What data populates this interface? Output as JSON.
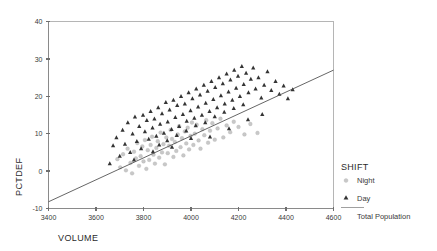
{
  "chart_data": {
    "type": "scatter",
    "title": "",
    "xlabel": "VOLUME",
    "ylabel": "PCTDEF",
    "xlim": [
      3400,
      4600
    ],
    "ylim": [
      -10,
      40
    ],
    "xticks": [
      3400,
      3600,
      3800,
      4000,
      4200,
      4400,
      4600
    ],
    "xtick_labels": [
      "3400",
      "3600",
      "3800",
      "4000",
      "4200",
      "4400",
      "4600"
    ],
    "yticks": [
      -10,
      0,
      10,
      20,
      30,
      40
    ],
    "ytick_labels": [
      "-10",
      "0",
      "10",
      "20",
      "30",
      "40"
    ],
    "grid": false,
    "legend": {
      "title": "SHIFT",
      "position": "right",
      "entries": [
        {
          "label": "Night",
          "marker": "circle",
          "color": "#c8c8c8"
        },
        {
          "label": "Day",
          "marker": "triangle",
          "color": "#343434"
        },
        {
          "label": "Total Population",
          "marker": "line",
          "color": "#555555"
        }
      ]
    },
    "fit_line": {
      "name": "Total Population",
      "x": [
        3400,
        4600
      ],
      "y": [
        -8.2,
        27.0
      ],
      "color": "#555555"
    },
    "series": [
      {
        "name": "Night",
        "marker": "circle",
        "color": "#c8c8c8",
        "points": [
          [
            3690,
            3.2
          ],
          [
            3702,
            1.0
          ],
          [
            3714,
            4.5
          ],
          [
            3726,
            0.2
          ],
          [
            3733,
            6.0
          ],
          [
            3745,
            2.2
          ],
          [
            3752,
            -0.6
          ],
          [
            3760,
            5.2
          ],
          [
            3768,
            3.4
          ],
          [
            3774,
            7.5
          ],
          [
            3781,
            1.4
          ],
          [
            3788,
            4.0
          ],
          [
            3795,
            6.6
          ],
          [
            3800,
            2.6
          ],
          [
            3806,
            8.3
          ],
          [
            3812,
            0.6
          ],
          [
            3818,
            5.6
          ],
          [
            3824,
            3.0
          ],
          [
            3830,
            7.0
          ],
          [
            3836,
            9.2
          ],
          [
            3842,
            4.4
          ],
          [
            3848,
            2.0
          ],
          [
            3854,
            6.2
          ],
          [
            3860,
            8.0
          ],
          [
            3866,
            3.6
          ],
          [
            3872,
            10.3
          ],
          [
            3878,
            5.0
          ],
          [
            3884,
            7.2
          ],
          [
            3890,
            1.8
          ],
          [
            3896,
            9.0
          ],
          [
            3902,
            4.8
          ],
          [
            3908,
            6.8
          ],
          [
            3914,
            11.0
          ],
          [
            3920,
            8.6
          ],
          [
            3926,
            3.8
          ],
          [
            3932,
            7.8
          ],
          [
            3938,
            5.4
          ],
          [
            3944,
            9.8
          ],
          [
            3950,
            12.0
          ],
          [
            3956,
            6.4
          ],
          [
            3962,
            8.8
          ],
          [
            3968,
            4.2
          ],
          [
            3974,
            10.6
          ],
          [
            3980,
            7.4
          ],
          [
            3986,
            11.6
          ],
          [
            3992,
            5.8
          ],
          [
            3998,
            9.4
          ],
          [
            4004,
            13.0
          ],
          [
            4010,
            7.0
          ],
          [
            4016,
            10.0
          ],
          [
            4024,
            12.4
          ],
          [
            4032,
            8.2
          ],
          [
            4040,
            6.0
          ],
          [
            4048,
            11.2
          ],
          [
            4056,
            9.6
          ],
          [
            4064,
            13.6
          ],
          [
            4072,
            7.6
          ],
          [
            4080,
            10.8
          ],
          [
            4090,
            12.8
          ],
          [
            4100,
            8.4
          ],
          [
            4112,
            11.4
          ],
          [
            4124,
            14.0
          ],
          [
            4136,
            9.0
          ],
          [
            4150,
            12.2
          ],
          [
            4165,
            10.4
          ],
          [
            4180,
            13.2
          ],
          [
            4200,
            11.8
          ],
          [
            4225,
            9.8
          ],
          [
            4250,
            12.6
          ],
          [
            4280,
            10.2
          ]
        ]
      },
      {
        "name": "Day",
        "marker": "triangle",
        "color": "#343434",
        "points": [
          [
            3658,
            2.0
          ],
          [
            3672,
            6.8
          ],
          [
            3686,
            9.0
          ],
          [
            3700,
            4.0
          ],
          [
            3712,
            11.0
          ],
          [
            3722,
            7.2
          ],
          [
            3734,
            13.0
          ],
          [
            3744,
            5.0
          ],
          [
            3754,
            10.0
          ],
          [
            3764,
            14.5
          ],
          [
            3772,
            8.0
          ],
          [
            3782,
            12.0
          ],
          [
            3790,
            6.0
          ],
          [
            3798,
            15.0
          ],
          [
            3806,
            10.6
          ],
          [
            3814,
            13.6
          ],
          [
            3822,
            8.6
          ],
          [
            3830,
            16.0
          ],
          [
            3838,
            11.6
          ],
          [
            3846,
            14.0
          ],
          [
            3854,
            9.4
          ],
          [
            3862,
            17.0
          ],
          [
            3870,
            12.6
          ],
          [
            3878,
            15.4
          ],
          [
            3886,
            10.2
          ],
          [
            3894,
            18.4
          ],
          [
            3902,
            13.2
          ],
          [
            3910,
            16.4
          ],
          [
            3918,
            11.2
          ],
          [
            3926,
            19.0
          ],
          [
            3934,
            14.4
          ],
          [
            3942,
            17.6
          ],
          [
            3950,
            12.0
          ],
          [
            3958,
            20.0
          ],
          [
            3966,
            15.2
          ],
          [
            3974,
            18.0
          ],
          [
            3982,
            13.4
          ],
          [
            3990,
            21.0
          ],
          [
            3998,
            16.2
          ],
          [
            4006,
            19.4
          ],
          [
            4014,
            14.2
          ],
          [
            4022,
            22.0
          ],
          [
            4030,
            17.2
          ],
          [
            4038,
            20.4
          ],
          [
            4046,
            15.0
          ],
          [
            4054,
            23.0
          ],
          [
            4062,
            18.2
          ],
          [
            4070,
            21.4
          ],
          [
            4078,
            16.0
          ],
          [
            4086,
            24.0
          ],
          [
            4094,
            19.2
          ],
          [
            4102,
            22.4
          ],
          [
            4110,
            17.0
          ],
          [
            4118,
            25.0
          ],
          [
            4126,
            20.2
          ],
          [
            4134,
            23.4
          ],
          [
            4142,
            18.0
          ],
          [
            4150,
            26.0
          ],
          [
            4158,
            21.2
          ],
          [
            4166,
            24.4
          ],
          [
            4174,
            19.0
          ],
          [
            4182,
            27.0
          ],
          [
            4190,
            22.2
          ],
          [
            4198,
            25.4
          ],
          [
            4206,
            20.0
          ],
          [
            4214,
            28.0
          ],
          [
            4222,
            23.2
          ],
          [
            4232,
            26.2
          ],
          [
            4242,
            21.0
          ],
          [
            4252,
            24.6
          ],
          [
            4262,
            27.6
          ],
          [
            4272,
            22.0
          ],
          [
            4284,
            25.0
          ],
          [
            4296,
            19.6
          ],
          [
            4308,
            23.0
          ],
          [
            4322,
            26.6
          ],
          [
            4338,
            21.6
          ],
          [
            4356,
            24.0
          ],
          [
            4372,
            20.6
          ],
          [
            4390,
            22.8
          ],
          [
            4408,
            19.4
          ],
          [
            4428,
            21.8
          ],
          [
            3866,
            7.0
          ],
          [
            3900,
            8.2
          ],
          [
            3940,
            9.6
          ],
          [
            3980,
            10.8
          ],
          [
            4020,
            12.2
          ],
          [
            4060,
            13.0
          ],
          [
            4100,
            14.6
          ],
          [
            4140,
            15.8
          ],
          [
            4180,
            16.8
          ],
          [
            4220,
            17.8
          ],
          [
            3760,
            3.0
          ],
          [
            3840,
            5.2
          ],
          [
            3920,
            6.4
          ],
          [
            4000,
            8.8
          ],
          [
            4080,
            9.2
          ],
          [
            4160,
            11.4
          ],
          [
            4240,
            13.8
          ],
          [
            4300,
            15.2
          ]
        ]
      }
    ]
  }
}
